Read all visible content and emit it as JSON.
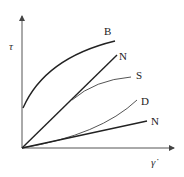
{
  "diagram": {
    "type": "flow-curve",
    "y_axis_label": "τ",
    "x_axis_label": "γ̇",
    "curves": [
      {
        "id": "bingham",
        "label": "B",
        "description": "Bingham plastic (yield stress, concave)",
        "color": "#222222",
        "width": 1.4
      },
      {
        "id": "newtonian-high",
        "label": "N",
        "description": "Newtonian (steep linear)",
        "color": "#222222",
        "width": 1.4
      },
      {
        "id": "shear-thinning",
        "label": "S",
        "description": "Shear-thinning (branches off steep N)",
        "color": "#555555",
        "width": 1.0
      },
      {
        "id": "dilatant",
        "label": "D",
        "description": "Dilatant (convex, shear-thickening)",
        "color": "#555555",
        "width": 1.0
      },
      {
        "id": "newtonian-low",
        "label": "N",
        "description": "Newtonian (shallow linear)",
        "color": "#222222",
        "width": 1.4
      }
    ]
  }
}
